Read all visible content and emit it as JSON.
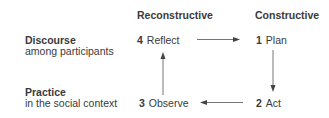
{
  "columns": {
    "reconstructive": "Reconstructive",
    "constructive": "Constructive"
  },
  "rows": {
    "discourse": {
      "title": "Discourse",
      "subtitle": "among participants"
    },
    "practice": {
      "title": "Practice",
      "subtitle": "in the social context"
    }
  },
  "steps": [
    {
      "num": "1",
      "label": "Plan"
    },
    {
      "num": "2",
      "label": "Act"
    },
    {
      "num": "3",
      "label": "Observe"
    },
    {
      "num": "4",
      "label": "Reflect"
    }
  ],
  "colors": {
    "text": "#3a3a3a",
    "arrow": "#555555"
  }
}
